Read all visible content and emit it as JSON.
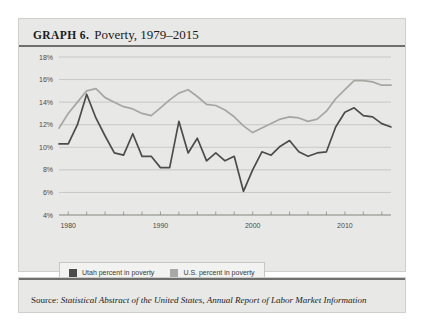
{
  "figure": {
    "label": "GRAPH 6.",
    "title": "Poverty, 1979–2015"
  },
  "source": {
    "prefix": "Source: ",
    "titles": "Statistical Abstract of the United States, Annual Report of Labor Market Information"
  },
  "legend": {
    "items": [
      {
        "label": "Utah percent in poverty",
        "color": "#4c4c4c",
        "swatch": "utah"
      },
      {
        "label": "U.S. percent in poverty",
        "color": "#a9a9a5",
        "swatch": "us"
      }
    ]
  },
  "colors": {
    "utah": "#4c4c4c",
    "us": "#a9a9a5",
    "panel": "#e8e8e6",
    "grid": "#b9b9b4",
    "rule": "#6f6f6d"
  },
  "chart_data": {
    "type": "line",
    "title": "Poverty, 1979–2015",
    "xlabel": "",
    "ylabel": "",
    "xlim": [
      1979,
      2015
    ],
    "ylim": [
      4,
      18
    ],
    "ytick_step": 2,
    "grid": true,
    "legend_position": "bottom-left",
    "ytick_labels": [
      "4%",
      "6%",
      "8%",
      "10%",
      "12%",
      "14%",
      "16%",
      "18%"
    ],
    "ytick_values": [
      4,
      6,
      8,
      10,
      12,
      14,
      16,
      18
    ],
    "xtick_labels": [
      "1980",
      "1990",
      "2000",
      "2010"
    ],
    "xtick_values": [
      1980,
      1990,
      2000,
      2010
    ],
    "x": [
      1979,
      1980,
      1981,
      1982,
      1983,
      1984,
      1985,
      1986,
      1987,
      1988,
      1989,
      1990,
      1991,
      1992,
      1993,
      1994,
      1995,
      1996,
      1997,
      1998,
      1999,
      2000,
      2001,
      2002,
      2003,
      2004,
      2005,
      2006,
      2007,
      2008,
      2009,
      2010,
      2011,
      2012,
      2013,
      2014,
      2015
    ],
    "series": [
      {
        "name": "Utah percent in poverty",
        "color": "#4c4c4c",
        "values": [
          10.3,
          10.3,
          12.0,
          14.7,
          12.6,
          11.0,
          9.5,
          9.3,
          11.2,
          9.2,
          9.2,
          8.2,
          8.2,
          12.3,
          9.5,
          10.8,
          8.8,
          9.5,
          8.8,
          9.2,
          6.1,
          8.0,
          9.6,
          9.3,
          10.1,
          10.6,
          9.6,
          9.2,
          9.5,
          9.6,
          11.8,
          13.1,
          13.5,
          12.8,
          12.7,
          12.1,
          11.8
        ]
      },
      {
        "name": "U.S. percent in poverty",
        "color": "#a9a9a5",
        "values": [
          11.7,
          13.0,
          14.0,
          15.0,
          15.2,
          14.4,
          14.0,
          13.6,
          13.4,
          13.0,
          12.8,
          13.5,
          14.2,
          14.8,
          15.1,
          14.5,
          13.8,
          13.7,
          13.3,
          12.7,
          11.9,
          11.3,
          11.7,
          12.1,
          12.5,
          12.7,
          12.6,
          12.3,
          12.5,
          13.2,
          14.3,
          15.1,
          15.9,
          15.9,
          15.8,
          15.5,
          15.5
        ]
      }
    ]
  }
}
